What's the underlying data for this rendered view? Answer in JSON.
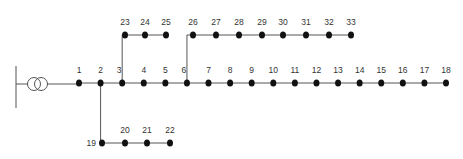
{
  "diagram": {
    "title": "",
    "type": "radial distribution network",
    "colors": {
      "line": "#555555",
      "node": "#111111",
      "label": "#333333"
    },
    "source": {
      "label": "",
      "icon": "transformer-icon",
      "x": 34,
      "y": 83
    },
    "nodes": [
      {
        "id": "1",
        "x": 79,
        "y": 83,
        "lx": 79,
        "ly": 72
      },
      {
        "id": "2",
        "x": 102,
        "y": 83,
        "lx": 102,
        "ly": 72
      },
      {
        "id": "3",
        "x": 125,
        "y": 83,
        "lx": 122,
        "ly": 72
      },
      {
        "id": "4",
        "x": 147,
        "y": 83,
        "lx": 147,
        "ly": 72
      },
      {
        "id": "5",
        "x": 170,
        "y": 83,
        "lx": 170,
        "ly": 72
      },
      {
        "id": "6",
        "x": 193,
        "y": 83,
        "lx": 189,
        "ly": 72
      },
      {
        "id": "7",
        "x": 216,
        "y": 83,
        "lx": 210,
        "ly": 72
      },
      {
        "id": "8",
        "x": 239,
        "y": 83,
        "lx": 231,
        "ly": 72
      },
      {
        "id": "9",
        "x": 262,
        "y": 83,
        "lx": 251,
        "ly": 72
      },
      {
        "id": "10",
        "x": 285,
        "y": 83,
        "lx": 273,
        "ly": 72
      },
      {
        "id": "11",
        "x": 308,
        "y": 83,
        "lx": 295,
        "ly": 72
      },
      {
        "id": "12",
        "x": 331,
        "y": 83,
        "lx": 315,
        "ly": 72
      },
      {
        "id": "13",
        "x": 354,
        "y": 83,
        "lx": 337,
        "ly": 72
      },
      {
        "id": "14",
        "x": 377,
        "y": 83,
        "lx": 356,
        "ly": 72
      },
      {
        "id": "15",
        "x": 400,
        "y": 83,
        "lx": 378,
        "ly": 72
      },
      {
        "id": "16",
        "x": 400,
        "y": 83,
        "lx": 400,
        "ly": 72
      },
      {
        "id": "17",
        "x": 423,
        "y": 83,
        "lx": 419,
        "ly": 72
      },
      {
        "id": "18",
        "x": 446,
        "y": 83,
        "lx": 438,
        "ly": 72
      },
      {
        "id": "19",
        "x": 102,
        "y": 143,
        "lx": 92,
        "ly": 146
      },
      {
        "id": "20",
        "x": 125,
        "y": 143,
        "lx": 125,
        "ly": 132
      },
      {
        "id": "21",
        "x": 147,
        "y": 143,
        "lx": 147,
        "ly": 132
      },
      {
        "id": "22",
        "x": 170,
        "y": 143,
        "lx": 170,
        "ly": 132
      },
      {
        "id": "23",
        "x": 125,
        "y": 35,
        "lx": 125,
        "ly": 24
      },
      {
        "id": "24",
        "x": 145,
        "y": 35,
        "lx": 145,
        "ly": 24
      },
      {
        "id": "25",
        "x": 166,
        "y": 35,
        "lx": 166,
        "ly": 24
      },
      {
        "id": "26",
        "x": 193,
        "y": 35,
        "lx": 193,
        "ly": 24
      },
      {
        "id": "27",
        "x": 216,
        "y": 35,
        "lx": 216,
        "ly": 24
      },
      {
        "id": "28",
        "x": 239,
        "y": 35,
        "lx": 239,
        "ly": 24
      },
      {
        "id": "29",
        "x": 262,
        "y": 35,
        "lx": 262,
        "ly": 24
      },
      {
        "id": "30",
        "x": 283,
        "y": 35,
        "lx": 283,
        "ly": 24
      },
      {
        "id": "31",
        "x": 306,
        "y": 35,
        "lx": 306,
        "ly": 24
      },
      {
        "id": "32",
        "x": 329,
        "y": 35,
        "lx": 329,
        "ly": 24
      },
      {
        "id": "33",
        "x": 351,
        "y": 35,
        "lx": 351,
        "ly": 24
      }
    ],
    "edges": [
      [
        "1",
        "2"
      ],
      [
        "2",
        "3"
      ],
      [
        "3",
        "4"
      ],
      [
        "4",
        "5"
      ],
      [
        "5",
        "6"
      ],
      [
        "6",
        "7"
      ],
      [
        "7",
        "8"
      ],
      [
        "8",
        "9"
      ],
      [
        "9",
        "10"
      ],
      [
        "10",
        "11"
      ],
      [
        "11",
        "12"
      ],
      [
        "12",
        "13"
      ],
      [
        "13",
        "14"
      ],
      [
        "14",
        "15"
      ],
      [
        "15",
        "16"
      ],
      [
        "16",
        "17"
      ],
      [
        "17",
        "18"
      ],
      [
        "2",
        "19"
      ],
      [
        "19",
        "20"
      ],
      [
        "20",
        "21"
      ],
      [
        "21",
        "22"
      ],
      [
        "3",
        "23"
      ],
      [
        "23",
        "24"
      ],
      [
        "24",
        "25"
      ],
      [
        "6",
        "26"
      ],
      [
        "26",
        "27"
      ],
      [
        "27",
        "28"
      ],
      [
        "28",
        "29"
      ],
      [
        "29",
        "30"
      ],
      [
        "30",
        "31"
      ],
      [
        "31",
        "32"
      ],
      [
        "32",
        "33"
      ]
    ]
  }
}
